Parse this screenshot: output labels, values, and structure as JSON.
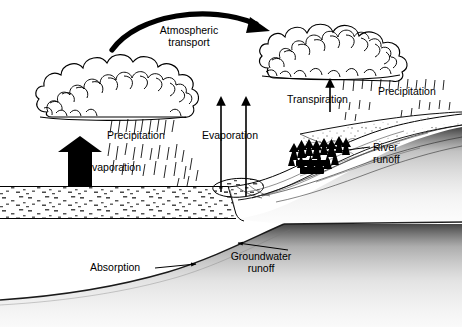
{
  "diagram": {
    "type": "line-drawing-diagram",
    "colors": {
      "ink": "#000000",
      "background": "#ffffff",
      "stipple": "#555555",
      "solid_arrow": "#000000"
    },
    "labels": {
      "atmospheric_transport": "Atmospheric\ntransport",
      "atmospheric_transport_line1": "Atmospheric",
      "atmospheric_transport_line2": "transport",
      "precipitation_left": "Precipitation",
      "evaporation_left": "Evaporation",
      "evaporation_center": "Evaporation",
      "transpiration": "Transpiration",
      "precipitation_right": "Precipitation",
      "river_runoff_line1": "River",
      "river_runoff_line2": "runoff",
      "groundwater_runoff_line1": "Groundwater",
      "groundwater_runoff_line2": "runoff",
      "absorption": "Absorption"
    },
    "elements": {
      "cloud_left": "cumulus-cloud",
      "cloud_right": "cumulus-cloud",
      "rain_left": "rain-streaks",
      "rain_right": "rain-streaks",
      "ocean": "stippled-water-body",
      "hillside": "stippled-ground-slope",
      "trees": "conifer-tree-cluster",
      "river": "river-channel",
      "arrow_transport": "curved-thick-arrow",
      "arrow_evaporation_solid": "thick-black-up-arrow",
      "arrow_evaporation_thin_1": "thin-up-arrow",
      "arrow_evaporation_thin_2": "thin-up-arrow",
      "arrow_transpiration": "thin-up-arrow",
      "leader_river_runoff": "leader-line-arrow",
      "leader_groundwater_runoff": "leader-line-arrow",
      "leader_absorption": "leader-line-arrow"
    }
  }
}
